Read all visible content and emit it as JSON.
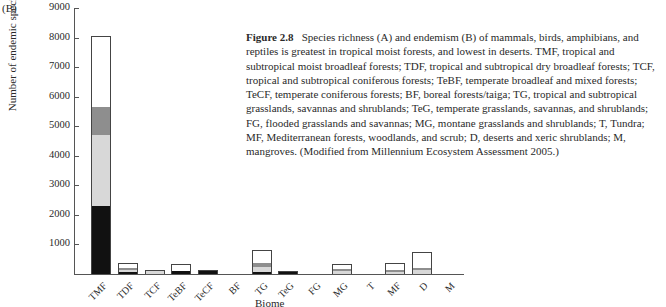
{
  "panel_label": "(B)",
  "caption": {
    "figure_number": "Figure 2.8",
    "text": "Species richness (A) and endemism (B) of mammals, birds, amphibians, and reptiles is greatest in tropical moist forests, and lowest in deserts. TMF, tropical and subtropical moist broadleaf forests; TDF, tropical and subtropical dry broadleaf forests; TCF, tropical and subtropical coniferous forests; TeBF, temperate broadleaf and mixed forests; TeCF, temperate coniferous forests; BF, boreal forests/taiga; TG, tropical and subtropical grasslands, savannas and shrublands; TeG, temperate grasslands, savannas, and shrublands; FG, flooded grasslands and savannas; MG, montane grasslands and shrublands; T, Tundra; MF, Mediterranean forests, woodlands, and scrub; D, deserts and xeric shrublands; M, mangroves. (Modified from Millennium Ecosystem Assessment 2005.)"
  },
  "chart_data": {
    "type": "bar",
    "stacked": true,
    "title": "",
    "xlabel": "Biome",
    "ylabel": "Number of endemic species",
    "ylim": [
      0,
      9000
    ],
    "yticks": [
      1000,
      2000,
      3000,
      4000,
      5000,
      6000,
      7000,
      8000,
      9000
    ],
    "grid": false,
    "legend": "none (segments are unlabeled taxa groups, bottom to top: black, light grey, dark grey, white)",
    "categories": [
      "TMF",
      "TDF",
      "TCF",
      "TeBF",
      "TeCF",
      "BF",
      "TG",
      "TeG",
      "FG",
      "MG",
      "T",
      "MF",
      "D",
      "M"
    ],
    "series": [
      {
        "name": "segment-1 (black)",
        "color": "#111111",
        "values": [
          2300,
          60,
          0,
          90,
          120,
          0,
          80,
          100,
          0,
          0,
          0,
          0,
          0,
          0
        ]
      },
      {
        "name": "segment-2 (light grey)",
        "color": "#d8d8d8",
        "values": [
          2400,
          60,
          130,
          0,
          0,
          0,
          150,
          0,
          0,
          100,
          0,
          80,
          150,
          0
        ]
      },
      {
        "name": "segment-3 (dark grey)",
        "color": "#8e8e8e",
        "values": [
          950,
          80,
          0,
          0,
          0,
          0,
          150,
          0,
          0,
          60,
          0,
          30,
          70,
          0
        ]
      },
      {
        "name": "segment-4 (white)",
        "color": "#ffffff",
        "values": [
          2400,
          150,
          0,
          260,
          0,
          0,
          420,
          0,
          0,
          170,
          0,
          210,
          520,
          0
        ]
      }
    ],
    "totals": [
      8050,
      350,
      130,
      350,
      120,
      0,
      800,
      100,
      0,
      330,
      0,
      320,
      740,
      0
    ]
  }
}
